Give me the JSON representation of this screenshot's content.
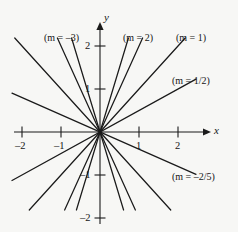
{
  "chart_data": {
    "type": "line",
    "title": "",
    "xlabel": "x",
    "ylabel": "y",
    "xlim": [
      -2.4,
      2.4
    ],
    "ylim": [
      -2.4,
      2.4
    ],
    "grid": false,
    "legend_position": "inline-annotations",
    "xticks": [
      -2,
      -1,
      1,
      2
    ],
    "xtick_labels": [
      "–2",
      "–1",
      "1",
      "2"
    ],
    "yticks": [
      2,
      1,
      -1,
      -2
    ],
    "ytick_labels": [
      "2",
      "1",
      "–1",
      "–2"
    ],
    "series": [
      {
        "name": "m = -3",
        "slope": -3,
        "intercept": 0,
        "label": "(m = –3)"
      },
      {
        "name": "m = 2",
        "slope": 2,
        "intercept": 0,
        "label": "(m = 2)"
      },
      {
        "name": "m = 1",
        "slope": 1,
        "intercept": 0,
        "label": "(m = 1)"
      },
      {
        "name": "m = 1/2",
        "slope": 0.5,
        "intercept": 0,
        "label": "(m = 1/2)"
      },
      {
        "name": "m = -2/5",
        "slope": -0.4,
        "intercept": 0,
        "label": "(m = –2/5)"
      },
      {
        "name": "m = 3",
        "slope": 3,
        "intercept": 0,
        "label": ""
      },
      {
        "name": "m = -1",
        "slope": -1,
        "intercept": 0,
        "label": ""
      },
      {
        "name": "m = -2",
        "slope": -2,
        "intercept": 0,
        "label": ""
      }
    ]
  },
  "axes": {
    "x_axis_label": "x",
    "y_axis_label": "y",
    "x_ticks": [
      {
        "value": -2,
        "label": "–2"
      },
      {
        "value": -1,
        "label": "–1"
      },
      {
        "value": 1,
        "label": "1"
      },
      {
        "value": 2,
        "label": "2"
      }
    ],
    "y_ticks": [
      {
        "value": 2,
        "label": "2"
      },
      {
        "value": 1,
        "label": "1"
      },
      {
        "value": -1,
        "label": "–1"
      },
      {
        "value": -2,
        "label": "–2"
      }
    ]
  },
  "annotations": {
    "m_neg3": "(m = –3)",
    "m_2": "(m = 2)",
    "m_1": "(m = 1)",
    "m_half": "(m = 1/2)",
    "m_neg2over5": "(m = –2/5)"
  },
  "colors": {
    "background": "#f7f7f5",
    "ink": "#151515",
    "axis": "#1a1a1a"
  }
}
